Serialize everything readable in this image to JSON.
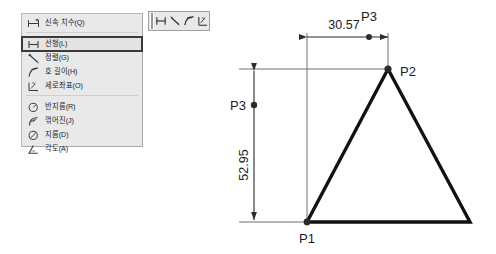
{
  "context_menu": {
    "name": "dimension-context-menu",
    "groups": [
      {
        "items": [
          {
            "label": "신속 치수(Q)",
            "icon": "quick-dimension-icon",
            "selected": false
          }
        ]
      },
      {
        "items": [
          {
            "label": "선형(L)",
            "icon": "linear-dimension-icon",
            "selected": true
          },
          {
            "label": "정렬(G)",
            "icon": "aligned-dimension-icon",
            "selected": false
          },
          {
            "label": "호 길이(H)",
            "icon": "arc-length-icon",
            "selected": false
          },
          {
            "label": "세로좌표(O)",
            "icon": "ordinate-dimension-icon",
            "selected": false
          }
        ]
      },
      {
        "items": [
          {
            "label": "반지름(R)",
            "icon": "radius-dimension-icon",
            "selected": false
          },
          {
            "label": "꺾어진(J)",
            "icon": "jogged-dimension-icon",
            "selected": false
          },
          {
            "label": "지름(D)",
            "icon": "diameter-dimension-icon",
            "selected": false
          },
          {
            "label": "각도(A)",
            "icon": "angular-dimension-icon",
            "selected": false
          }
        ]
      }
    ]
  },
  "mini_toolbar": {
    "name": "dimension-toolbar",
    "buttons": [
      {
        "icon": "linear-dimension-icon",
        "label": "선형"
      },
      {
        "icon": "aligned-dimension-icon",
        "label": "정렬"
      },
      {
        "icon": "arc-length-icon",
        "label": "호 길이"
      },
      {
        "icon": "ordinate-dimension-icon",
        "label": "세로좌표"
      }
    ]
  },
  "drawing": {
    "name": "triangle-dimension-drawing",
    "horizontal_dimension": {
      "value": "30.57",
      "marker_label": "P3"
    },
    "vertical_dimension": {
      "value": "52.95",
      "marker_label": "P3"
    },
    "points": [
      {
        "label": "P1"
      },
      {
        "label": "P2"
      }
    ]
  }
}
